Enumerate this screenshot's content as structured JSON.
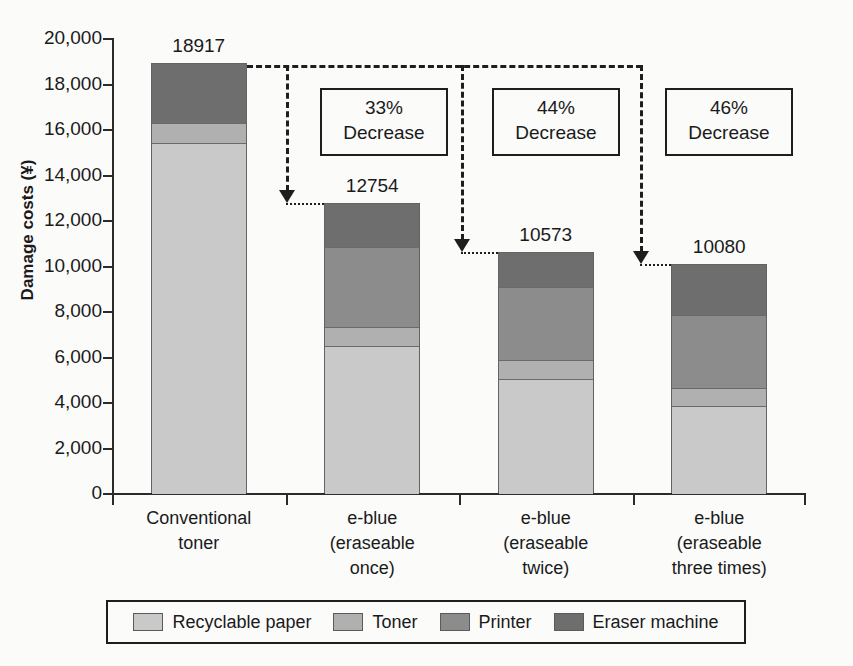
{
  "chart_data": {
    "type": "bar",
    "subtype": "stacked-bar",
    "title": "",
    "xlabel": "",
    "ylabel": "Damage costs (¥)",
    "ylim": [
      0,
      20000
    ],
    "ytick_step": 2000,
    "ytick_labels": [
      "20,000",
      "18,000",
      "16,000",
      "14,000",
      "12,000",
      "10,000",
      "8,000",
      "6,000",
      "4,000",
      "2,000",
      "0"
    ],
    "ytick_values": [
      20000,
      18000,
      16000,
      14000,
      12000,
      10000,
      8000,
      6000,
      4000,
      2000,
      0
    ],
    "grid": false,
    "legend_position": "bottom",
    "categories": [
      "Conventional toner",
      "e-blue (eraseable once)",
      "e-blue (eraseable twice)",
      "e-blue (eraseable three times)"
    ],
    "category_lines": [
      [
        "Conventional",
        "toner"
      ],
      [
        "e-blue",
        "(eraseable",
        "once)"
      ],
      [
        "e-blue",
        "(eraseable",
        "twice)"
      ],
      [
        "e-blue",
        "(eraseable",
        "three times)"
      ]
    ],
    "series": [
      {
        "name": "Recyclable paper",
        "color": "#c9c9c9",
        "values": [
          15430,
          6520,
          5060,
          3850
        ]
      },
      {
        "name": "Toner",
        "color": "#b0b0b0",
        "values": [
          880,
          830,
          840,
          830
        ]
      },
      {
        "name": "Printer",
        "color": "#8c8c8c",
        "values": [
          0,
          3520,
          3200,
          3210
        ]
      },
      {
        "name": "Eraser machine",
        "color": "#6e6e6e",
        "values": [
          2607,
          1884,
          1473,
          2190
        ]
      }
    ],
    "totals": [
      18917,
      12754,
      10573,
      10080
    ],
    "total_labels": [
      "18917",
      "12754",
      "10573",
      "10080"
    ],
    "annotations": [
      {
        "percent": "33%",
        "word": "Decrease",
        "from": 0,
        "to": 1
      },
      {
        "percent": "44%",
        "word": "Decrease",
        "from": 0,
        "to": 2
      },
      {
        "percent": "46%",
        "word": "Decrease",
        "from": 0,
        "to": 3
      }
    ]
  },
  "legend": {
    "items": [
      {
        "label": "Recyclable paper",
        "color": "#c9c9c9"
      },
      {
        "label": "Toner",
        "color": "#b0b0b0"
      },
      {
        "label": "Printer",
        "color": "#8c8c8c"
      },
      {
        "label": "Eraser machine",
        "color": "#6e6e6e"
      }
    ]
  },
  "colors": {
    "axis": "#2b2b2b",
    "annotation_border": "#1e1e1e",
    "background": "#fbfbfa"
  }
}
